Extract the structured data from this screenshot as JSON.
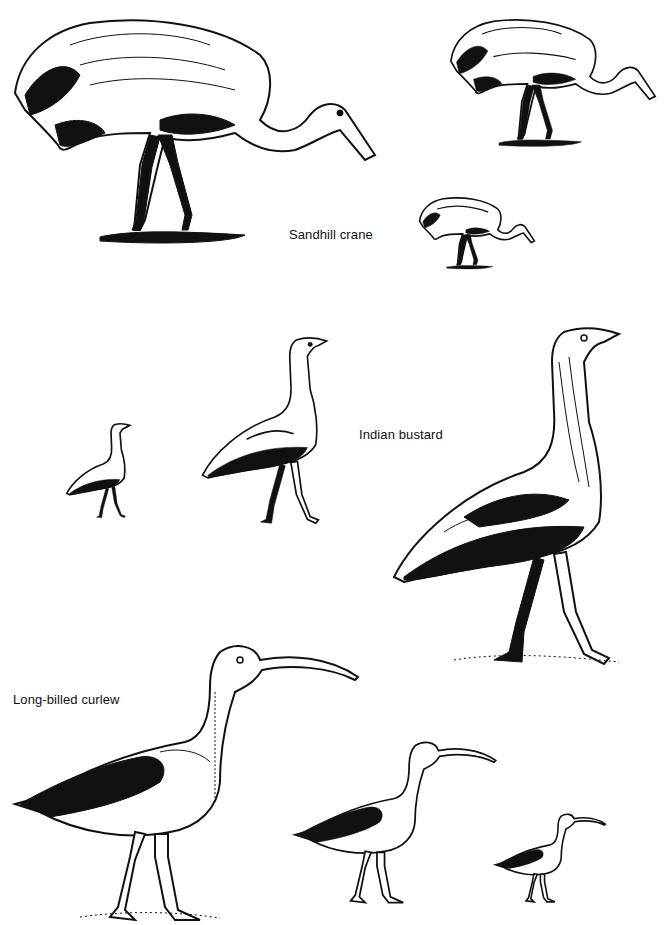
{
  "figure": {
    "background": "#ffffff",
    "ink": "#111111",
    "species": [
      {
        "name": "Sandhill crane",
        "label": "Sandhill crane",
        "sizes": [
          "large",
          "medium",
          "small"
        ]
      },
      {
        "name": "Indian bustard",
        "label": "Indian bustard",
        "sizes": [
          "small",
          "medium",
          "large"
        ]
      },
      {
        "name": "Long-billed curlew",
        "label": "Long-billed curlew",
        "sizes": [
          "large",
          "medium",
          "small"
        ]
      }
    ]
  }
}
